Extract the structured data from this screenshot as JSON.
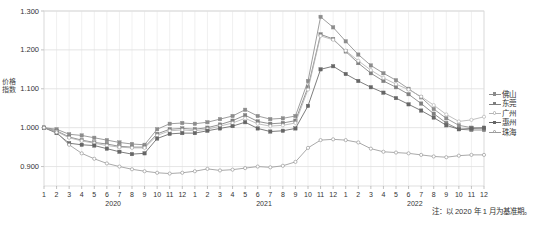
{
  "chart_data": {
    "type": "line",
    "title": "",
    "xlabel": "",
    "ylabel": "价格指数",
    "ylim": [
      0.85,
      1.3
    ],
    "yticks": [
      0.9,
      1.0,
      1.1,
      1.2,
      1.3
    ],
    "ytick_labels": [
      "0.900",
      "1.000",
      "1.100",
      "1.200",
      "1.300"
    ],
    "grid": true,
    "legend_position": "right",
    "note": "注：以 2020 年 1 月为基准期。",
    "x": [
      "1",
      "2",
      "3",
      "4",
      "5",
      "6",
      "7",
      "8",
      "9",
      "10",
      "11",
      "12",
      "1",
      "2",
      "3",
      "4",
      "5",
      "6",
      "7",
      "8",
      "9",
      "10",
      "11",
      "12",
      "1",
      "2",
      "3",
      "4",
      "5",
      "6",
      "7",
      "8",
      "9",
      "10",
      "11",
      "12"
    ],
    "year_groups": [
      {
        "label": "2020",
        "start_index": 0,
        "end_index": 11
      },
      {
        "label": "2021",
        "start_index": 12,
        "end_index": 23
      },
      {
        "label": "2022",
        "start_index": 24,
        "end_index": 35
      }
    ],
    "series": [
      {
        "name": "佛山",
        "color": "#8c8c8c",
        "marker": "square",
        "values": [
          1.0,
          0.996,
          0.983,
          0.98,
          0.974,
          0.968,
          0.962,
          0.958,
          0.956,
          0.996,
          1.01,
          1.012,
          1.01,
          1.014,
          1.022,
          1.03,
          1.046,
          1.03,
          1.022,
          1.024,
          1.03,
          1.12,
          1.285,
          1.258,
          1.222,
          1.188,
          1.16,
          1.14,
          1.122,
          1.1,
          1.078,
          1.048,
          1.024,
          1.006,
          1.0,
          0.998
        ]
      },
      {
        "name": "东莞",
        "color": "#7f7f7f",
        "marker": "square",
        "values": [
          1.0,
          0.992,
          0.976,
          0.968,
          0.962,
          0.958,
          0.952,
          0.95,
          0.95,
          0.984,
          0.996,
          0.998,
          0.996,
          1.0,
          1.008,
          1.018,
          1.032,
          1.016,
          1.01,
          1.012,
          1.018,
          1.104,
          1.24,
          1.228,
          1.196,
          1.166,
          1.14,
          1.12,
          1.104,
          1.086,
          1.062,
          1.036,
          1.012,
          0.996,
          0.994,
          0.994
        ]
      },
      {
        "name": "广州",
        "color": "#b5b5b5",
        "marker": "circle-open",
        "values": [
          1.0,
          0.99,
          0.974,
          0.966,
          0.96,
          0.954,
          0.95,
          0.948,
          0.948,
          0.98,
          0.992,
          0.994,
          0.992,
          0.996,
          1.004,
          1.012,
          1.024,
          1.01,
          1.004,
          1.006,
          1.012,
          1.098,
          1.236,
          1.226,
          1.198,
          1.172,
          1.148,
          1.128,
          1.112,
          1.098,
          1.08,
          1.058,
          1.034,
          1.016,
          1.02,
          1.028
        ]
      },
      {
        "name": "惠州",
        "color": "#666666",
        "marker": "square",
        "values": [
          1.0,
          0.986,
          0.96,
          0.956,
          0.954,
          0.946,
          0.938,
          0.932,
          0.934,
          0.972,
          0.984,
          0.986,
          0.986,
          0.992,
          0.998,
          1.004,
          1.014,
          0.998,
          0.99,
          0.992,
          0.998,
          1.056,
          1.15,
          1.158,
          1.138,
          1.12,
          1.104,
          1.09,
          1.076,
          1.06,
          1.044,
          1.026,
          1.006,
          0.996,
          0.998,
          1.0
        ]
      },
      {
        "name": "珠海",
        "color": "#9a9a9a",
        "marker": "circle-open",
        "values": [
          1.0,
          0.988,
          0.956,
          0.934,
          0.92,
          0.908,
          0.9,
          0.893,
          0.888,
          0.884,
          0.882,
          0.884,
          0.888,
          0.894,
          0.89,
          0.892,
          0.896,
          0.9,
          0.898,
          0.902,
          0.912,
          0.948,
          0.968,
          0.97,
          0.968,
          0.962,
          0.946,
          0.938,
          0.936,
          0.934,
          0.93,
          0.926,
          0.924,
          0.928,
          0.93,
          0.93
        ]
      }
    ]
  }
}
